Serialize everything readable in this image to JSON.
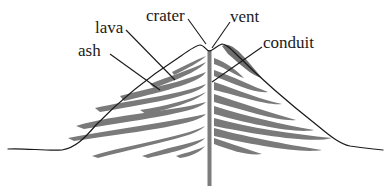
{
  "diagram": {
    "labels": {
      "crater": "crater",
      "vent": "vent",
      "lava": "lava",
      "ash": "ash",
      "conduit": "conduit"
    },
    "colors": {
      "outline": "#1a1a1a",
      "lava_layers": "#7a7a7a",
      "conduit": "#7c7c7c",
      "background": "#ffffff"
    }
  }
}
